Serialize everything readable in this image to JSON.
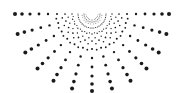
{
  "graphic": {
    "type": "half-sunburst-dot-pattern",
    "icon": "radial-dots-logo",
    "center": [
      92,
      14
    ],
    "color": "#1a1a1a",
    "background": "#ffffff",
    "main_rays": {
      "count": 13,
      "start_angle_deg": 0,
      "end_angle_deg": 180,
      "dot_radii_from_center": [
        8,
        14,
        20,
        27,
        35,
        44,
        53,
        62,
        70,
        77
      ],
      "dot_sizes": [
        0.5,
        0.6,
        0.7,
        0.85,
        1.0,
        1.2,
        1.4,
        1.6,
        1.8,
        2.0
      ]
    },
    "minor_rays": {
      "count": 12,
      "offset_deg": 7.5,
      "dot_radii_from_center": [
        6,
        10,
        14,
        19,
        24,
        30,
        36
      ],
      "dot_sizes": [
        0.4,
        0.45,
        0.5,
        0.6,
        0.7,
        0.8,
        0.9
      ]
    }
  }
}
